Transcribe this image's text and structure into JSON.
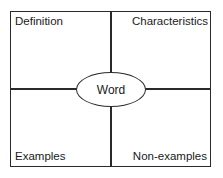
{
  "diagram": {
    "type": "frayer-model",
    "center": {
      "label": "Word"
    },
    "quadrants": [
      {
        "position": "top-left",
        "label": "Definition"
      },
      {
        "position": "top-right",
        "label": "Characteristics"
      },
      {
        "position": "bottom-left",
        "label": "Examples"
      },
      {
        "position": "bottom-right",
        "label": "Non-examples"
      }
    ],
    "colors": {
      "line": "#2a2a2a",
      "background": "#ffffff",
      "text": "#1a1a1a"
    }
  }
}
